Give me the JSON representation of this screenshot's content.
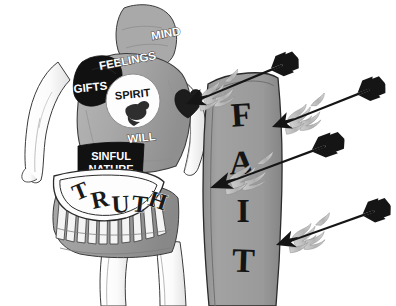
{
  "image": {
    "title": "Spiritual armor diagram",
    "width": 396,
    "height": 306,
    "background_color": "#ffffff",
    "style": "black-and-white grayscale line illustration"
  },
  "figure": {
    "skin_color": "#fdfdfd",
    "outline_color": "#2b2b2b",
    "tunic_color": "#a8a8a8",
    "skirt_color": "#9d9d9d",
    "dark_patch_color": "#111111"
  },
  "labels": [
    {
      "id": "mind",
      "text": "MIND",
      "style": "white-on-gray",
      "x": 152,
      "y": 40,
      "size": 11.5,
      "rotate": -10
    },
    {
      "id": "feelings",
      "text": "FEELINGS",
      "style": "white-on-gray",
      "x": 105,
      "y": 69,
      "size": 11.5,
      "rotate": -10
    },
    {
      "id": "gifts",
      "text": "GIFTS",
      "style": "white-on-black",
      "x": 72,
      "y": 93,
      "size": 11.5,
      "rotate": -6
    },
    {
      "id": "spirit",
      "text": "SPIRIT",
      "style": "dark-on-white",
      "x": 119,
      "y": 97,
      "size": 11,
      "rotate": -6
    },
    {
      "id": "will",
      "text": "WILL",
      "style": "white-on-gray",
      "x": 130,
      "y": 142,
      "size": 11.5,
      "rotate": -6
    }
  ],
  "sinful_nature": {
    "line1": "SINFUL",
    "line2": "NATURE",
    "background_color": "#111111",
    "text_color": "#ffffff"
  },
  "truth_belt": {
    "text": "TRUTH",
    "letters": [
      "T",
      "R",
      "U",
      "T",
      "H"
    ],
    "band_color": "#ffffff",
    "text_color": "#1a1a1a"
  },
  "spirit_emblem": {
    "label": "SPIRIT",
    "icon": "dove-icon",
    "circle_color": "#fdfdfd"
  },
  "shield": {
    "label_full": "FAITH",
    "visible_letters": [
      "F",
      "A",
      "I",
      "T"
    ],
    "note": "final letter H is cropped off the bottom edge",
    "face_color": "#9a9a9a",
    "edge_color": "#8a8a8a",
    "outline_color": "#2b2b2b"
  },
  "arrows": {
    "count": 4,
    "name": "flaming-arrow",
    "shaft_color": "#151515",
    "flame_color": "#b4b4b4",
    "description": "Four flaming arrows flying right-to-left toward the shield",
    "items": [
      {
        "id": "arrow-1",
        "tip_x": 186,
        "tip_y": 104,
        "tail_x": 300,
        "tail_y": 58,
        "length": 123,
        "angle": -22,
        "hits_shield": true
      },
      {
        "id": "arrow-2",
        "tip_x": 272,
        "tip_y": 127,
        "tail_x": 392,
        "tail_y": 80,
        "length": 129,
        "angle": -21,
        "hits_shield": false
      },
      {
        "id": "arrow-3",
        "tip_x": 210,
        "tip_y": 188,
        "tail_x": 352,
        "tail_y": 137,
        "length": 151,
        "angle": -20,
        "hits_shield": true
      },
      {
        "id": "arrow-4",
        "tip_x": 276,
        "tip_y": 245,
        "tail_x": 392,
        "tail_y": 204,
        "length": 123,
        "angle": -19,
        "hits_shield": false
      }
    ]
  },
  "heart_patch": {
    "name": "heart-wound",
    "color": "#1c1c1c",
    "x": 178,
    "y": 104
  }
}
